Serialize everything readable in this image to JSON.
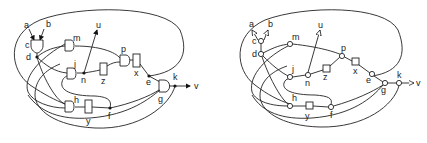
{
  "figure": {
    "left_panel": {
      "title": "gate-level circuit",
      "labels": {
        "a": "a",
        "b": "b",
        "c": "c",
        "d": "d",
        "m": "m",
        "u": "u",
        "p": "p",
        "j": "j",
        "n": "n",
        "z": "z",
        "x": "x",
        "e": "e",
        "k": "k",
        "v": "v",
        "g": "g",
        "h": "h",
        "y": "y",
        "f": "f"
      }
    },
    "right_panel": {
      "title": "graph representation",
      "labels": {
        "a": "a",
        "b": "b",
        "c": "c",
        "d": "d",
        "m": "m",
        "u": "u",
        "p": "p",
        "j": "j",
        "n": "n",
        "z": "z",
        "x": "x",
        "e": "e",
        "k": "k",
        "v": "v",
        "g": "g",
        "h": "h",
        "y": "y",
        "f": "f"
      }
    }
  }
}
